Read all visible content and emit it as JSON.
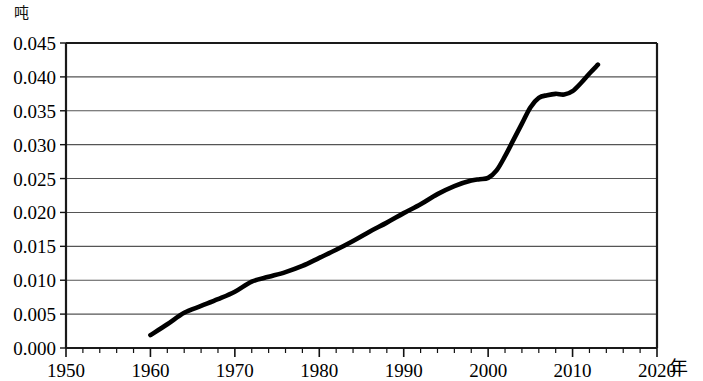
{
  "chart_data": {
    "type": "line",
    "title": "",
    "subtitle": "",
    "xlabel": "年",
    "ylabel": "吨",
    "unit_y": "吨",
    "unit_x": "年",
    "xlim": [
      1950,
      2020
    ],
    "ylim": [
      0.0,
      0.045
    ],
    "grid": true,
    "grid_axis": "y",
    "legend": false,
    "legend_position": "none",
    "y_ticks": [
      0.0,
      0.005,
      0.01,
      0.015,
      0.02,
      0.025,
      0.03,
      0.035,
      0.04,
      0.045
    ],
    "y_tick_labels": [
      "0.000",
      "0.005",
      "0.010",
      "0.015",
      "0.020",
      "0.025",
      "0.030",
      "0.035",
      "0.040",
      "0.045"
    ],
    "x_ticks": [
      1950,
      1960,
      1970,
      1980,
      1990,
      2000,
      2010,
      2020
    ],
    "x_tick_labels": [
      "1950",
      "1960",
      "1970",
      "1980",
      "1990",
      "2000",
      "2010",
      "2020"
    ],
    "x_minor_tick_step": 2,
    "series": [
      {
        "name": "人均消费量",
        "color": "#000000",
        "x": [
          1960,
          1962,
          1964,
          1966,
          1968,
          1970,
          1972,
          1974,
          1976,
          1978,
          1980,
          1982,
          1984,
          1986,
          1988,
          1990,
          1992,
          1994,
          1996,
          1998,
          1999,
          2000,
          2001,
          2002,
          2003,
          2004,
          2005,
          2006,
          2007,
          2008,
          2009,
          2010,
          2011,
          2012,
          2013
        ],
        "values": [
          0.0019,
          0.0035,
          0.0052,
          0.0062,
          0.0072,
          0.0083,
          0.0098,
          0.0105,
          0.0112,
          0.0121,
          0.0133,
          0.0145,
          0.0158,
          0.0172,
          0.0185,
          0.0199,
          0.0212,
          0.0227,
          0.0239,
          0.0247,
          0.0249,
          0.0251,
          0.0262,
          0.0283,
          0.0307,
          0.0331,
          0.0355,
          0.0369,
          0.0373,
          0.0375,
          0.0374,
          0.0379,
          0.0391,
          0.0405,
          0.0418
        ]
      }
    ],
    "annotations": []
  },
  "axis": {
    "y_unit_label": "吨",
    "x_unit_label": "年"
  }
}
